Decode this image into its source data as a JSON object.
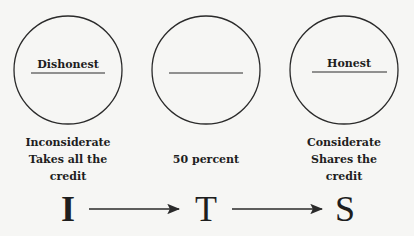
{
  "diagram": {
    "nodes": [
      {
        "id": "dishonest",
        "circle_label": "Dishonest",
        "description": [
          "Inconsiderate",
          "Takes all the",
          "credit"
        ],
        "letter": "I"
      },
      {
        "id": "middle",
        "circle_label": "",
        "description": [
          "50 percent"
        ],
        "letter": "T"
      },
      {
        "id": "honest",
        "circle_label": "Honest",
        "description": [
          "Considerate",
          "Shares the",
          "credit"
        ],
        "letter": "S"
      }
    ],
    "edges": [
      {
        "from": "I",
        "to": "T"
      },
      {
        "from": "T",
        "to": "S"
      }
    ],
    "colors": {
      "stroke": "#2a2a2a",
      "background": "#f6f6f4"
    }
  }
}
